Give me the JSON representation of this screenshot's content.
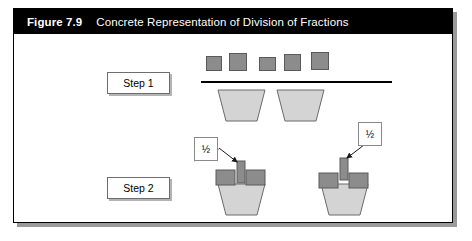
{
  "figure": {
    "number_label": "Figure 7.9",
    "caption": "Concrete Representation of Division of Fractions",
    "title_bar_color": "#000000",
    "title_text_color": "#ffffff",
    "frame_border_color": "#000000",
    "frame_shadow_color": "#9a9a9a",
    "background_color": "#ffffff"
  },
  "steps": [
    {
      "id": "step-1",
      "label": "Step 1"
    },
    {
      "id": "step-2",
      "label": "Step 2"
    }
  ],
  "callouts": [
    {
      "id": "fraction-left",
      "label": "½"
    },
    {
      "id": "fraction-right",
      "label": "½"
    }
  ],
  "colors": {
    "unit_square_fill": "#8c8c8c",
    "unit_square_stroke": "#5a5a5a",
    "trapezoid_fill": "#d4d4d4",
    "trapezoid_stroke": "#6b6b6b",
    "divider_line": "#000000",
    "callout_border": "#8a8a8a",
    "step_box_border": "#6d6d6d",
    "step_box_shadow": "#b4b4b4",
    "arrow_color": "#1a1a1a"
  },
  "step1": {
    "unit_squares": [
      {
        "x": 192,
        "y": 22,
        "w": 16,
        "h": 15
      },
      {
        "x": 215,
        "y": 19,
        "w": 18,
        "h": 18
      },
      {
        "x": 245,
        "y": 23,
        "w": 17,
        "h": 14
      },
      {
        "x": 270,
        "y": 20,
        "w": 17,
        "h": 17
      },
      {
        "x": 297,
        "y": 18,
        "w": 18,
        "h": 18
      }
    ],
    "divider": {
      "x": 187,
      "y": 47,
      "w": 191
    },
    "trapezoids": [
      {
        "x": 204,
        "y": 56,
        "top_w": 47,
        "bottom_w": 31,
        "h": 31
      },
      {
        "x": 263,
        "y": 56,
        "top_w": 47,
        "bottom_w": 31,
        "h": 31
      }
    ]
  },
  "step2": {
    "groups": [
      {
        "id": "group-left",
        "trapezoid": {
          "x": 204,
          "y": 150,
          "top_w": 47,
          "bottom_w": 31,
          "h": 31
        },
        "block_left": {
          "x": 202,
          "y": 136,
          "w": 19,
          "h": 15
        },
        "block_right": {
          "x": 232,
          "y": 136,
          "w": 19,
          "h": 15
        },
        "insert_block": {
          "x": 223,
          "y": 127,
          "w": 8,
          "h": 22
        },
        "arrow": {
          "x1": 205,
          "y1": 114,
          "x2": 223,
          "y2": 128
        },
        "leader": {
          "x1": 204,
          "y1": 115,
          "x2": 206,
          "y2": 116
        }
      },
      {
        "id": "group-right",
        "trapezoid": {
          "x": 307,
          "y": 150,
          "top_w": 47,
          "bottom_w": 31,
          "h": 31
        },
        "block_left": {
          "x": 305,
          "y": 139,
          "w": 19,
          "h": 15
        },
        "block_right": {
          "x": 335,
          "y": 139,
          "w": 19,
          "h": 15
        },
        "insert_block": {
          "x": 326,
          "y": 124,
          "w": 8,
          "h": 22
        },
        "arrow": {
          "x1": 350,
          "y1": 111,
          "x2": 333,
          "y2": 124
        },
        "leader": {
          "x1": 351,
          "y1": 112,
          "x2": 352,
          "y2": 112
        }
      }
    ]
  }
}
